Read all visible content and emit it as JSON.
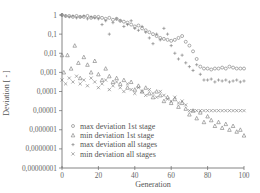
{
  "chart_data": {
    "type": "scatter",
    "title": "",
    "xlabel": "Generation",
    "ylabel": "Deviation [ - ]",
    "xlim": [
      0,
      100
    ],
    "ylim": [
      1e-08,
      1
    ],
    "yscale": "log",
    "grid": false,
    "legend_position": "lower left (inside)",
    "x_ticks": [
      0,
      20,
      40,
      60,
      80,
      100
    ],
    "x_tick_labels": [
      "0",
      "20",
      "40",
      "60",
      "80",
      "100"
    ],
    "y_ticks": [
      1,
      0.1,
      0.01,
      0.001,
      0.0001,
      1e-05,
      1e-06,
      1e-07,
      1e-08
    ],
    "y_tick_labels": [
      "1",
      "0,1",
      "0,01",
      "0,001",
      "0,0001",
      "0,00001",
      "0,000001",
      "0,0000001",
      "0,00000001"
    ],
    "series": [
      {
        "name": "max deviation 1st stage",
        "marker": "circle",
        "x": [
          0,
          2,
          4,
          6,
          8,
          10,
          12,
          14,
          16,
          18,
          20,
          22,
          24,
          26,
          28,
          30,
          32,
          34,
          36,
          38,
          40,
          42,
          44,
          46,
          48,
          50,
          52,
          54,
          56,
          58,
          60,
          62,
          64,
          66,
          68,
          70,
          72,
          74,
          76,
          78,
          80,
          82,
          84,
          86,
          88,
          90,
          92,
          94,
          96,
          98,
          100
        ],
        "log10_y": [
          0,
          -0.05,
          -0.05,
          -0.1,
          -0.05,
          -0.1,
          -0.1,
          -0.05,
          -0.15,
          -0.1,
          -0.1,
          -0.15,
          -0.2,
          -0.15,
          -0.25,
          -0.2,
          -0.3,
          -0.35,
          -0.4,
          -0.5,
          -0.6,
          -0.55,
          -0.7,
          -0.8,
          -0.9,
          -1.0,
          -1.1,
          -1.2,
          -1.25,
          -1.3,
          -1.35,
          -1.3,
          -1.2,
          -1.1,
          -1.4,
          -1.6,
          -1.9,
          -2.3,
          -2.7,
          -2.8,
          -2.8,
          -2.85,
          -2.8,
          -2.8,
          -2.75,
          -2.8,
          -2.7,
          -2.75,
          -2.8,
          -2.8,
          -2.8
        ]
      },
      {
        "name": "min deviation 1st stage",
        "marker": "triangle",
        "x": [
          0,
          1,
          3,
          5,
          7,
          9,
          10,
          12,
          14,
          16,
          18,
          20,
          22,
          24,
          26,
          28,
          30,
          32,
          34,
          36,
          38,
          40,
          42,
          44,
          46,
          48,
          50,
          52,
          54,
          56,
          58,
          60,
          62,
          64,
          66,
          68,
          70,
          72,
          74,
          76,
          78,
          80,
          82,
          84,
          86,
          88,
          90,
          92,
          94,
          96,
          98,
          100
        ],
        "log10_y": [
          -2.1,
          -3.0,
          -2.1,
          -2.8,
          -1.6,
          -2.5,
          -3.3,
          -2.2,
          -2.6,
          -3.0,
          -2.4,
          -3.1,
          -3.4,
          -2.8,
          -3.2,
          -3.5,
          -3.3,
          -3.6,
          -3.4,
          -3.8,
          -3.5,
          -3.9,
          -3.7,
          -4.0,
          -3.8,
          -4.1,
          -4.3,
          -4.0,
          -4.2,
          -4.5,
          -4.3,
          -4.6,
          -4.4,
          -4.8,
          -4.6,
          -4.9,
          -5.2,
          -5.0,
          -5.4,
          -5.1,
          -5.6,
          -5.3,
          -5.5,
          -5.8,
          -5.6,
          -5.9,
          -5.7,
          -6.0,
          -5.8,
          -6.1,
          -6.0,
          -6.3
        ]
      },
      {
        "name": "max deviation all stages",
        "marker": "plus",
        "x": [
          0,
          2,
          4,
          6,
          8,
          10,
          12,
          14,
          16,
          18,
          20,
          22,
          24,
          26,
          28,
          30,
          32,
          34,
          36,
          38,
          40,
          42,
          44,
          46,
          48,
          50,
          52,
          54,
          56,
          58,
          60,
          62,
          64,
          66,
          68,
          70,
          72,
          74,
          76,
          78,
          80,
          82,
          84,
          86,
          88,
          90,
          92,
          94,
          96,
          98,
          100
        ],
        "log10_y": [
          0,
          -0.05,
          -0.1,
          -0.05,
          -0.15,
          -0.1,
          -0.05,
          -0.2,
          -0.1,
          -0.15,
          -0.2,
          -0.5,
          -0.3,
          -1.0,
          -0.4,
          -0.2,
          -0.3,
          -0.6,
          -0.5,
          -0.3,
          -0.7,
          -0.8,
          -0.6,
          -0.9,
          -1.2,
          -1.5,
          -1.0,
          -1.3,
          -0.7,
          -1.0,
          -1.6,
          -2.0,
          -2.3,
          -2.1,
          -2.5,
          -2.7,
          -2.9,
          -2.6,
          -3.1,
          -3.4,
          -3.4,
          -3.35,
          -3.5,
          -3.4,
          -3.45,
          -3.4,
          -3.5,
          -3.45,
          -3.4,
          -3.5,
          -3.45
        ]
      },
      {
        "name": "min deviation all stages",
        "marker": "cross",
        "x": [
          0,
          2,
          4,
          6,
          8,
          10,
          12,
          14,
          16,
          18,
          20,
          22,
          24,
          26,
          28,
          30,
          32,
          34,
          36,
          38,
          40,
          42,
          44,
          46,
          48,
          50,
          52,
          54,
          56,
          58,
          60,
          62,
          64,
          66,
          68,
          70,
          72,
          74,
          76,
          78,
          80,
          82,
          84,
          86,
          88,
          90,
          92,
          94,
          96,
          98,
          100
        ],
        "log10_y": [
          -3.4,
          -3.6,
          -3.3,
          -3.5,
          -3.2,
          -3.6,
          -3.4,
          -3.7,
          -3.3,
          -3.5,
          -3.8,
          -3.6,
          -3.4,
          -3.9,
          -3.7,
          -3.5,
          -3.8,
          -4.0,
          -3.6,
          -3.9,
          -4.1,
          -3.8,
          -4.0,
          -4.2,
          -3.9,
          -4.1,
          -4.3,
          -4.0,
          -4.2,
          -4.4,
          -4.5,
          -4.3,
          -4.6,
          -4.5,
          -4.7,
          -5.0,
          -5.0,
          -5.0,
          -5.0,
          -5.0,
          -5.0,
          -5.0,
          -5.0,
          -5.0,
          -5.0,
          -5.0,
          -5.0,
          -5.0,
          -5.0,
          -5.0,
          -5.0
        ]
      }
    ]
  },
  "legend": {
    "items": [
      {
        "marker": "circle",
        "label": "max deviation 1st stage"
      },
      {
        "marker": "triangle",
        "label": "min deviation 1st stage"
      },
      {
        "marker": "plus",
        "label": "max deviation all stages"
      },
      {
        "marker": "cross",
        "label": "min deviation all stages"
      }
    ]
  },
  "colors": {
    "marker": "#777777",
    "axis": "#666666",
    "text": "#555555",
    "background": "#ffffff"
  }
}
